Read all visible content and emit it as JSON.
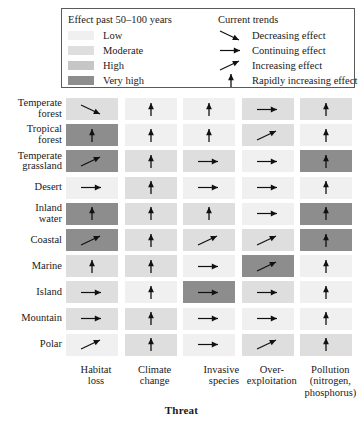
{
  "legend": {
    "effect_title": "Effect past 50–100 years",
    "trends_title": "Current trends",
    "effect_levels": [
      {
        "label": "Low",
        "color": "#f0f0f0"
      },
      {
        "label": "Moderate",
        "color": "#dedede"
      },
      {
        "label": "High",
        "color": "#c6c6c6"
      },
      {
        "label": "Very high",
        "color": "#8d8d8d"
      }
    ],
    "trends": [
      {
        "label": "Decreasing effect",
        "icon": "arrow-down-right-icon",
        "key": "decreasing"
      },
      {
        "label": "Continuing effect",
        "icon": "arrow-right-icon",
        "key": "continuing"
      },
      {
        "label": "Increasing effect",
        "icon": "arrow-up-right-icon",
        "key": "increasing"
      },
      {
        "label": "Rapidly increasing effect",
        "icon": "arrow-up-icon",
        "key": "rapid"
      }
    ]
  },
  "axis_title": "Threat",
  "chart_data": {
    "type": "heatmap",
    "title": "",
    "xlabel": "Threat",
    "ylabel": "",
    "grid": false,
    "legend_position": "top",
    "categories": [
      "Habitat loss",
      "Climate change",
      "Invasive species",
      "Over-exploitation",
      "Pollution (nitrogen, phosphorus)"
    ],
    "column_labels": [
      [
        "Habitat",
        "loss"
      ],
      [
        "Climate",
        "change"
      ],
      [
        "Invasive",
        "species"
      ],
      [
        "Over-",
        "exploitation"
      ],
      [
        "Pollution",
        "(nitrogen,",
        "phosphorus)"
      ]
    ],
    "rows": [
      "Temperate forest",
      "Tropical forest",
      "Temperate grassland",
      "Desert",
      "Inland water",
      "Coastal",
      "Marine",
      "Island",
      "Mountain",
      "Polar"
    ],
    "row_labels": [
      [
        "Temperate",
        "forest"
      ],
      [
        "Tropical",
        "forest"
      ],
      [
        "Temperate",
        "grassland"
      ],
      [
        "Desert"
      ],
      [
        "Inland",
        "water"
      ],
      [
        "Coastal"
      ],
      [
        "Marine"
      ],
      [
        "Island"
      ],
      [
        "Mountain"
      ],
      [
        "Polar"
      ]
    ],
    "effect_scale": [
      "Low",
      "Moderate",
      "High",
      "Very high"
    ],
    "effect_colors": [
      "#f0f0f0",
      "#dedede",
      "#c6c6c6",
      "#8d8d8d"
    ],
    "trend_scale": [
      "decreasing",
      "continuing",
      "increasing",
      "rapid"
    ],
    "cells": [
      [
        {
          "effect": "Moderate",
          "trend": "decreasing"
        },
        {
          "effect": "Low",
          "trend": "rapid"
        },
        {
          "effect": "Low",
          "trend": "rapid"
        },
        {
          "effect": "Moderate",
          "trend": "continuing"
        },
        {
          "effect": "Moderate",
          "trend": "rapid"
        }
      ],
      [
        {
          "effect": "Very high",
          "trend": "rapid"
        },
        {
          "effect": "Low",
          "trend": "rapid"
        },
        {
          "effect": "Low",
          "trend": "rapid"
        },
        {
          "effect": "Moderate",
          "trend": "increasing"
        },
        {
          "effect": "Low",
          "trend": "rapid"
        }
      ],
      [
        {
          "effect": "Very high",
          "trend": "increasing"
        },
        {
          "effect": "Moderate",
          "trend": "rapid"
        },
        {
          "effect": "Moderate",
          "trend": "continuing"
        },
        {
          "effect": "Low",
          "trend": "continuing"
        },
        {
          "effect": "Very high",
          "trend": "rapid"
        }
      ],
      [
        {
          "effect": "Low",
          "trend": "continuing"
        },
        {
          "effect": "Moderate",
          "trend": "rapid"
        },
        {
          "effect": "Low",
          "trend": "continuing"
        },
        {
          "effect": "Low",
          "trend": "continuing"
        },
        {
          "effect": "Low",
          "trend": "rapid"
        }
      ],
      [
        {
          "effect": "Very high",
          "trend": "rapid"
        },
        {
          "effect": "Moderate",
          "trend": "rapid"
        },
        {
          "effect": "Moderate",
          "trend": "rapid"
        },
        {
          "effect": "Low",
          "trend": "continuing"
        },
        {
          "effect": "Very high",
          "trend": "rapid"
        }
      ],
      [
        {
          "effect": "Very high",
          "trend": "increasing"
        },
        {
          "effect": "Moderate",
          "trend": "rapid"
        },
        {
          "effect": "Moderate",
          "trend": "increasing"
        },
        {
          "effect": "Moderate",
          "trend": "increasing"
        },
        {
          "effect": "Very high",
          "trend": "rapid"
        }
      ],
      [
        {
          "effect": "Moderate",
          "trend": "rapid"
        },
        {
          "effect": "Moderate",
          "trend": "rapid"
        },
        {
          "effect": "Low",
          "trend": "continuing"
        },
        {
          "effect": "Very high",
          "trend": "increasing"
        },
        {
          "effect": "Low",
          "trend": "rapid"
        }
      ],
      [
        {
          "effect": "Moderate",
          "trend": "continuing"
        },
        {
          "effect": "Low",
          "trend": "rapid"
        },
        {
          "effect": "Very high",
          "trend": "continuing"
        },
        {
          "effect": "Moderate",
          "trend": "continuing"
        },
        {
          "effect": "Low",
          "trend": "rapid"
        }
      ],
      [
        {
          "effect": "Moderate",
          "trend": "continuing"
        },
        {
          "effect": "Moderate",
          "trend": "rapid"
        },
        {
          "effect": "Low",
          "trend": "continuing"
        },
        {
          "effect": "Low",
          "trend": "continuing"
        },
        {
          "effect": "Low",
          "trend": "rapid"
        }
      ],
      [
        {
          "effect": "Low",
          "trend": "increasing"
        },
        {
          "effect": "Moderate",
          "trend": "rapid"
        },
        {
          "effect": "Low",
          "trend": "continuing"
        },
        {
          "effect": "Moderate",
          "trend": "increasing"
        },
        {
          "effect": "Moderate",
          "trend": "rapid"
        }
      ]
    ]
  }
}
